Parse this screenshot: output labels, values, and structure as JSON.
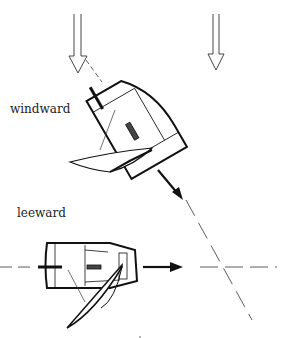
{
  "labels": {
    "windward": "windward",
    "leeward": "leeward"
  },
  "colors": {
    "ink": "#1a1a1a",
    "background": "#ffffff"
  },
  "elements": {
    "wind_arrows": 2,
    "boats": [
      "windward-boat",
      "leeward-boat"
    ],
    "heading_arrows": 2,
    "course_lines": 2
  }
}
